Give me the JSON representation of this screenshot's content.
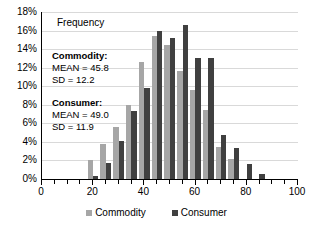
{
  "chart_data": {
    "type": "bar",
    "title": "",
    "subtitle": "",
    "xlabel": "",
    "ylabel": "Frequency",
    "ylim": [
      0,
      18
    ],
    "xlim": [
      0,
      100
    ],
    "grid": true,
    "legend_position": "bottom",
    "y_tick_labels": [
      "18%",
      "16%",
      "14%",
      "12%",
      "10%",
      "8%",
      "6%",
      "4%",
      "2%",
      "0%"
    ],
    "y_tick_values": [
      18,
      16,
      14,
      12,
      10,
      8,
      6,
      4,
      2,
      0
    ],
    "x_tick_labels": [
      "0",
      "20",
      "40",
      "60",
      "80",
      "100"
    ],
    "x_tick_values": [
      0,
      20,
      40,
      60,
      80,
      100
    ],
    "x_minor_step": 5,
    "categories": [
      20,
      25,
      30,
      35,
      40,
      45,
      50,
      55,
      60,
      65,
      70,
      75,
      80,
      85
    ],
    "series": [
      {
        "name": "Commodity",
        "color": "#a6a6a6",
        "values": [
          2.0,
          3.8,
          5.6,
          8.0,
          12.6,
          15.4,
          14.4,
          11.6,
          9.6,
          7.4,
          3.5,
          2.2,
          0.0,
          0.0
        ]
      },
      {
        "name": "Consumer",
        "color": "#404040",
        "values": [
          0.3,
          1.7,
          4.1,
          7.3,
          9.8,
          15.9,
          15.2,
          16.6,
          13.0,
          13.0,
          4.7,
          3.3,
          1.6,
          0.5
        ]
      }
    ]
  },
  "annotations": {
    "frequency_label": "Frequency",
    "commodity_heading": "Commodity:",
    "commodity_mean": "MEAN = 45.8",
    "commodity_sd": "SD = 12.2",
    "consumer_heading": "Consumer:",
    "consumer_mean": "MEAN  = 49.0",
    "consumer_sd": "SD = 11.9"
  },
  "legend": {
    "items": [
      {
        "label": "Commodity",
        "color": "#a6a6a6"
      },
      {
        "label": "Consumer",
        "color": "#404040"
      }
    ]
  },
  "colors": {
    "commodity": "#a6a6a6",
    "consumer": "#404040",
    "gridline": "#d9d9d9",
    "axis": "#000000",
    "background": "#ffffff"
  }
}
